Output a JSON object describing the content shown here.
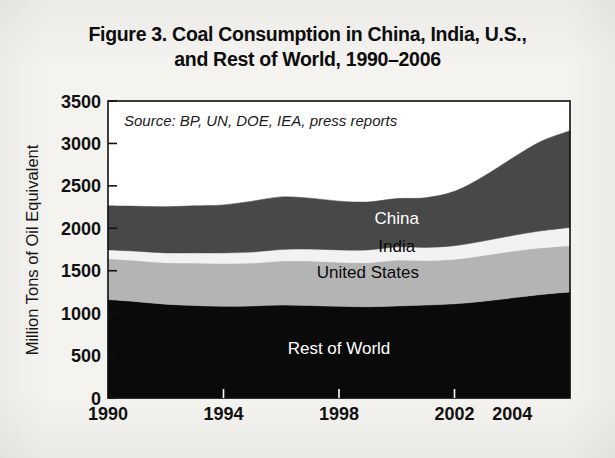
{
  "title": {
    "line1": "Figure 3. Coal Consumption in China, India, U.S.,",
    "line2": "and Rest of World, 1990–2006"
  },
  "source_note": "Source: BP, UN, DOE, IEA, press reports",
  "colors": {
    "rest_of_world": "#0a0a0a",
    "united_states": "#b4b4b4",
    "india": "#f2f2f2",
    "china": "#484848",
    "axis": "#111111",
    "plot_background": "#ffffff",
    "page_background": "#f4f3f0"
  },
  "series_labels": {
    "china": "China",
    "india": "India",
    "united_states": "United States",
    "rest_of_world": "Rest of World"
  },
  "chart_data": {
    "type": "area",
    "stacked": true,
    "title": "Figure 3. Coal Consumption in China, India, U.S., and Rest of World, 1990–2006",
    "xlabel": "",
    "ylabel": "Million Tons of Oil Equivalent",
    "xlim": [
      1990,
      2006
    ],
    "ylim": [
      0,
      3500
    ],
    "yticks": [
      0,
      500,
      1000,
      1500,
      2000,
      2500,
      3000,
      3500
    ],
    "ytick_labels": [
      "0",
      "500",
      "1000",
      "1500",
      "2000",
      "2500",
      "3000",
      "3500"
    ],
    "xticks": [
      1990,
      1994,
      1998,
      2002,
      2004
    ],
    "xtick_labels": [
      "1990",
      "1994",
      "1998",
      "2002",
      "2004"
    ],
    "grid": false,
    "legend": "inline-labels",
    "x": [
      1990,
      1991,
      1992,
      1993,
      1994,
      1995,
      1996,
      1997,
      1998,
      1999,
      2000,
      2001,
      2002,
      2003,
      2004,
      2005,
      2006
    ],
    "series": [
      {
        "name": "Rest of World",
        "color": "#0a0a0a",
        "values": [
          1160,
          1135,
          1105,
          1090,
          1080,
          1085,
          1095,
          1090,
          1080,
          1075,
          1085,
          1095,
          1110,
          1140,
          1180,
          1220,
          1250
        ]
      },
      {
        "name": "United States",
        "color": "#b4b4b4",
        "values": [
          480,
          485,
          490,
          500,
          505,
          505,
          520,
          525,
          520,
          520,
          540,
          525,
          525,
          540,
          550,
          550,
          545
        ]
      },
      {
        "name": "India",
        "color": "#f2f2f2",
        "values": [
          105,
          110,
          115,
          120,
          125,
          130,
          135,
          140,
          145,
          150,
          155,
          155,
          160,
          170,
          185,
          200,
          215
        ]
      },
      {
        "name": "China",
        "color": "#484848",
        "values": [
          520,
          530,
          545,
          555,
          565,
          600,
          620,
          600,
          575,
          565,
          570,
          585,
          640,
          760,
          910,
          1055,
          1140
        ]
      }
    ],
    "totals": [
      2265,
      2260,
      2255,
      2265,
      2275,
      2320,
      2370,
      2355,
      2320,
      2310,
      2350,
      2360,
      2435,
      2610,
      2825,
      3025,
      3150
    ]
  },
  "label_positions": {
    "china": {
      "x": 2000,
      "y": 2050
    },
    "india": {
      "x": 2000,
      "y": 1720
    },
    "united_states": {
      "x": 1999,
      "y": 1420
    },
    "rest_of_world": {
      "x": 1998,
      "y": 520
    }
  }
}
